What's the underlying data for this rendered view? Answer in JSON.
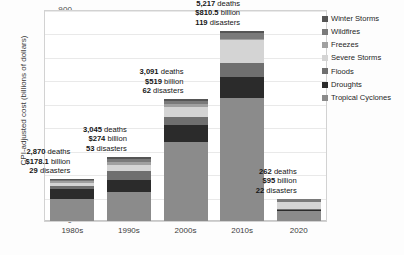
{
  "chart_data": {
    "type": "bar",
    "title": "",
    "subtitle": "",
    "xlabel": "",
    "ylabel": "CPI-adjusted cost (billions of dollars)",
    "ylim": [
      0,
      900
    ],
    "ytick_step": 100,
    "yticks": [
      "900",
      "800",
      "700",
      "600",
      "500",
      "400",
      "300",
      "200",
      "100",
      "0"
    ],
    "grid": true,
    "stacked": true,
    "legend_position": "right",
    "categories": [
      "1980s",
      "1990s",
      "2000s",
      "2010s",
      "2020"
    ],
    "series": [
      {
        "name": "Tropical Cyclones",
        "color": "#8b8b8b",
        "values": [
          96.0,
          125.0,
          335.0,
          525.0,
          42.0
        ]
      },
      {
        "name": "Droughts",
        "color": "#2b2b2b",
        "values": [
          40.0,
          52.0,
          75.0,
          90.0,
          4.5
        ]
      },
      {
        "name": "Floods",
        "color": "#6f6f6f",
        "values": [
          14.0,
          38.0,
          35.0,
          58.0,
          3.0
        ]
      },
      {
        "name": "Severe Storms",
        "color": "#d4d4d4",
        "values": [
          13.0,
          25.0,
          42.0,
          98.0,
          31.5
        ]
      },
      {
        "name": "Freezes",
        "color": "#a0a0a0",
        "values": [
          8.0,
          10.0,
          12.0,
          7.0,
          2.0
        ]
      },
      {
        "name": "Wildfires",
        "color": "#7a7a7a",
        "values": [
          4.0,
          14.0,
          12.0,
          22.5,
          10.0
        ]
      },
      {
        "name": "Winter Storms",
        "color": "#555555",
        "values": [
          3.1,
          10.0,
          8.0,
          10.0,
          2.0
        ]
      }
    ],
    "totals": [
      178.1,
      274.0,
      519.0,
      810.5,
      95.0
    ],
    "annotations": [
      {
        "category": "1980s",
        "deaths": "2,870",
        "deaths_unit": "deaths",
        "cost": "$178.1",
        "cost_unit": "billion",
        "disasters": "29",
        "disasters_unit": "disasters"
      },
      {
        "category": "1990s",
        "deaths": "3,045",
        "deaths_unit": "deaths",
        "cost": "$274",
        "cost_unit": "billion",
        "disasters": "53",
        "disasters_unit": "disasters"
      },
      {
        "category": "2000s",
        "deaths": "3,091",
        "deaths_unit": "deaths",
        "cost": "$519",
        "cost_unit": "billion",
        "disasters": "62",
        "disasters_unit": "disasters"
      },
      {
        "category": "2010s",
        "deaths": "5,217",
        "deaths_unit": "deaths",
        "cost": "$810.5",
        "cost_unit": "billion",
        "disasters": "119",
        "disasters_unit": "disasters"
      },
      {
        "category": "2020",
        "deaths": "262",
        "deaths_unit": "deaths",
        "cost": "$95",
        "cost_unit": "billion",
        "disasters": "22",
        "disasters_unit": "disasters"
      }
    ],
    "legend_entries": [
      {
        "label": "Winter Storms",
        "color": "#555555"
      },
      {
        "label": "Wildfires",
        "color": "#7a7a7a"
      },
      {
        "label": "Freezes",
        "color": "#a0a0a0"
      },
      {
        "label": "Severe Storms",
        "color": "#d4d4d4"
      },
      {
        "label": "Floods",
        "color": "#6f6f6f"
      },
      {
        "label": "Droughts",
        "color": "#2b2b2b"
      },
      {
        "label": "Tropical Cyclones",
        "color": "#8b8b8b"
      }
    ]
  }
}
